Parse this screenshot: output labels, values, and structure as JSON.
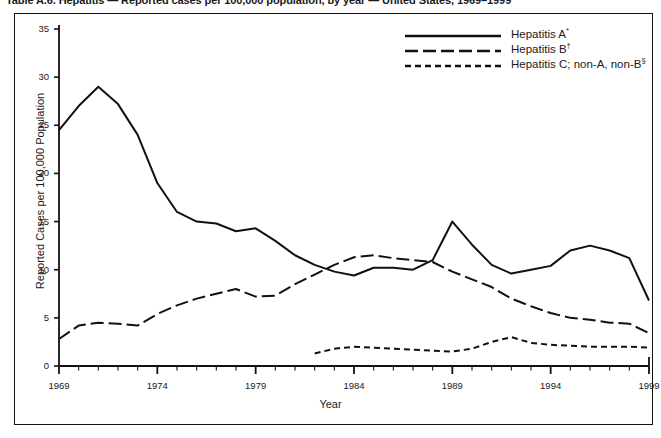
{
  "caption": {
    "text": "Table A.6. Hepatitis — Reported cases per 100,000 population, by year — United States, 1969–1999"
  },
  "axes": {
    "ylabel": "Reported Cases per 100,000 Population",
    "xlabel": "Year",
    "yticks": [
      "0",
      "5",
      "10",
      "15",
      "20",
      "25",
      "30",
      "35"
    ],
    "xticks": [
      "1969",
      "1974",
      "1979",
      "1984",
      "1989",
      "1994",
      "1999"
    ]
  },
  "legend": [
    {
      "name": "Hepatitis A",
      "sup": "*",
      "style": "solid"
    },
    {
      "name": "Hepatitis B",
      "sup": "†",
      "style": "long-dash"
    },
    {
      "name": "Hepatitis C; non-A, non-B",
      "sup": "§",
      "style": "short-dash"
    }
  ],
  "colors": {
    "line": "#111111",
    "axis": "#111111",
    "background": "#ffffff",
    "text": "#1a1a1a"
  },
  "chart_data": {
    "type": "line",
    "title": "Hepatitis — Reported cases per 100,000 population, by year — United States, 1969–1999",
    "xlabel": "Year",
    "ylabel": "Reported Cases per 100,000 Population",
    "xlim": [
      1969,
      1999
    ],
    "ylim": [
      0,
      35
    ],
    "grid": false,
    "legend_position": "top-right",
    "x": [
      1969,
      1970,
      1971,
      1972,
      1973,
      1974,
      1975,
      1976,
      1977,
      1978,
      1979,
      1980,
      1981,
      1982,
      1983,
      1984,
      1985,
      1986,
      1987,
      1988,
      1989,
      1990,
      1991,
      1992,
      1993,
      1994,
      1995,
      1996,
      1997,
      1998,
      1999
    ],
    "series": [
      {
        "name": "Hepatitis A*",
        "style": "solid",
        "values": [
          24.5,
          27.0,
          29.0,
          27.2,
          24.0,
          19.0,
          16.0,
          15.0,
          14.8,
          14.0,
          14.3,
          13.0,
          11.5,
          10.5,
          9.8,
          9.4,
          10.2,
          10.2,
          10.0,
          11.0,
          15.0,
          12.6,
          10.5,
          9.6,
          10.0,
          10.4,
          12.0,
          12.5,
          12.0,
          11.2,
          6.8
        ]
      },
      {
        "name": "Hepatitis B†",
        "style": "long-dash",
        "values": [
          2.8,
          4.2,
          4.5,
          4.4,
          4.2,
          5.4,
          6.3,
          7.0,
          7.5,
          8.0,
          7.2,
          7.3,
          8.5,
          9.5,
          10.5,
          11.3,
          11.5,
          11.2,
          11.0,
          10.8,
          9.8,
          9.0,
          8.2,
          7.0,
          6.2,
          5.5,
          5.0,
          4.8,
          4.5,
          4.4,
          3.4
        ]
      },
      {
        "name": "Hepatitis C; non-A, non-B§",
        "style": "short-dash",
        "values": [
          null,
          null,
          null,
          null,
          null,
          null,
          null,
          null,
          null,
          null,
          null,
          null,
          null,
          1.3,
          1.8,
          2.0,
          1.9,
          1.8,
          1.7,
          1.6,
          1.5,
          1.8,
          2.5,
          3.0,
          2.4,
          2.2,
          2.1,
          2.0,
          2.0,
          2.0,
          1.9
        ]
      }
    ]
  }
}
